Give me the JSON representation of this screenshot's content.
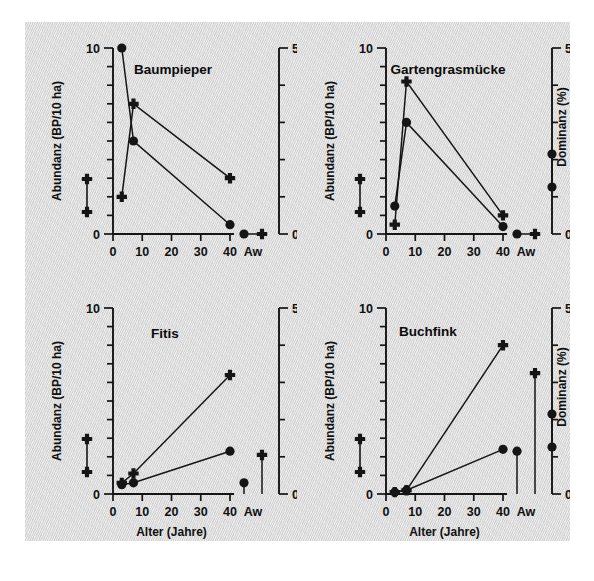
{
  "figure": {
    "background_color": "#dcdcdc",
    "page_color": "#ffffff",
    "ink_color": "#151515"
  },
  "axes": {
    "x_label": "Alter (Jahre)",
    "y_left_label": "Abundanz (BP/10 ha)",
    "y_right_label": "Dominanz (%)",
    "x_ticks": [
      "0",
      "10",
      "20",
      "30",
      "40"
    ],
    "x_extra_tick": "Aw",
    "y_left_ticks": [
      "0",
      "10"
    ],
    "y_right_ticks": [
      "0",
      "50"
    ]
  },
  "series_names": {
    "abundanz": "Abundanz (BP/10 ha)",
    "dominanz": "Dominanz (%)"
  },
  "panels": [
    {
      "id": "panel-baumpieper",
      "title": "Baumpieper"
    },
    {
      "id": "panel-gartengrasmuecke",
      "title": "Gartengrasmücke"
    },
    {
      "id": "panel-fitis",
      "title": "Fitis"
    },
    {
      "id": "panel-buchfink",
      "title": "Buchfink"
    }
  ],
  "chart_data": [
    {
      "type": "line",
      "title": "Baumpieper",
      "xlabel": "Alter (Jahre)",
      "ylabel": "Abundanz (BP/10 ha)",
      "y2label": "Dominanz (%)",
      "xlim": [
        0,
        40
      ],
      "ylim": [
        0,
        10
      ],
      "y2lim": [
        0,
        50
      ],
      "x": [
        3,
        7,
        40
      ],
      "categories": [
        "3",
        "7",
        "40",
        "Aw"
      ],
      "grid": false,
      "legend": "none",
      "series": [
        {
          "name": "Abundanz (BP/10 ha)",
          "marker": "circle",
          "axis": "left",
          "values": [
            10.0,
            5.0,
            0.5
          ],
          "aw": 0.0
        },
        {
          "name": "Dominanz (%)",
          "marker": "plus",
          "axis": "right",
          "values": [
            10.0,
            35.0,
            15.0
          ],
          "values_left_scale": [
            2.0,
            7.0,
            3.0
          ],
          "aw": 0.0
        }
      ]
    },
    {
      "type": "line",
      "title": "Gartengrasmücke",
      "xlabel": "Alter (Jahre)",
      "ylabel": "Abundanz (BP/10 ha)",
      "y2label": "Dominanz (%)",
      "xlim": [
        0,
        40
      ],
      "ylim": [
        0,
        10
      ],
      "y2lim": [
        0,
        50
      ],
      "x": [
        3,
        7,
        40
      ],
      "categories": [
        "3",
        "7",
        "40",
        "Aw"
      ],
      "grid": false,
      "legend": "none",
      "series": [
        {
          "name": "Abundanz (BP/10 ha)",
          "marker": "circle",
          "axis": "left",
          "values": [
            1.5,
            6.0,
            0.4
          ],
          "aw": 0.0
        },
        {
          "name": "Dominanz (%)",
          "marker": "plus",
          "axis": "right",
          "values": [
            2.5,
            41.0,
            5.0
          ],
          "values_left_scale": [
            0.5,
            8.2,
            1.0
          ],
          "aw": 0.0
        }
      ]
    },
    {
      "type": "line",
      "title": "Fitis",
      "xlabel": "Alter (Jahre)",
      "ylabel": "Abundanz (BP/10 ha)",
      "y2label": "Dominanz (%)",
      "xlim": [
        0,
        40
      ],
      "ylim": [
        0,
        10
      ],
      "y2lim": [
        0,
        50
      ],
      "x": [
        3,
        7,
        40
      ],
      "categories": [
        "3",
        "7",
        "40",
        "Aw"
      ],
      "grid": false,
      "legend": "none",
      "series": [
        {
          "name": "Abundanz (BP/10 ha)",
          "marker": "circle",
          "axis": "left",
          "values": [
            0.5,
            0.6,
            2.3
          ],
          "aw": 0.6
        },
        {
          "name": "Dominanz (%)",
          "marker": "plus",
          "axis": "right",
          "values": [
            3.0,
            5.5,
            32.0
          ],
          "values_left_scale": [
            0.6,
            1.1,
            6.4
          ],
          "aw": 10.5
        }
      ]
    },
    {
      "type": "line",
      "title": "Buchfink",
      "xlabel": "Alter (Jahre)",
      "ylabel": "Abundanz (BP/10 ha)",
      "y2label": "Dominanz (%)",
      "xlim": [
        0,
        40
      ],
      "ylim": [
        0,
        10
      ],
      "y2lim": [
        0,
        50
      ],
      "x": [
        3,
        7,
        40
      ],
      "categories": [
        "3",
        "7",
        "40",
        "Aw"
      ],
      "grid": false,
      "legend": "none",
      "series": [
        {
          "name": "Abundanz (BP/10 ha)",
          "marker": "circle",
          "axis": "left",
          "values": [
            0.1,
            0.2,
            2.4
          ],
          "aw": 2.3
        },
        {
          "name": "Dominanz (%)",
          "marker": "plus",
          "axis": "right",
          "values": [
            0.5,
            1.0,
            40.0
          ],
          "values_left_scale": [
            0.1,
            0.2,
            8.0
          ],
          "aw": 32.5
        }
      ]
    }
  ],
  "legend_markers": {
    "left_axis_top": "plus",
    "left_axis_bottom": "plus",
    "right_axis_top": "circle",
    "right_axis_bottom": "circle"
  }
}
